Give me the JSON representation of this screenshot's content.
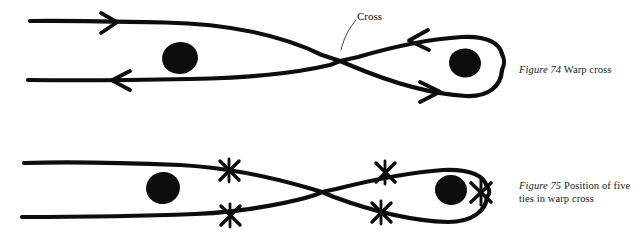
{
  "page": {
    "width": 638,
    "height": 232,
    "background": "#ffffff",
    "ink_color": "#0d0d0d",
    "style": "hand-drawn pen and ink weaving diagram"
  },
  "annotations": {
    "cross_label": "Cross"
  },
  "figures": [
    {
      "id": "figure-74",
      "number": "Figure 74",
      "title": "Warp cross",
      "caption_line_1": "Figure 74  Warp",
      "caption_line_2": "cross",
      "arrows": [
        {
          "name": "upper-left-arrow",
          "direction": "right",
          "x": 110,
          "y": 23
        },
        {
          "name": "lower-left-arrow",
          "direction": "left",
          "x": 118,
          "y": 82
        },
        {
          "name": "upper-right-arrow",
          "direction": "left",
          "x": 416,
          "y": 40
        },
        {
          "name": "lower-right-arrow",
          "direction": "right",
          "x": 433,
          "y": 92
        }
      ],
      "blobs": [
        {
          "name": "left-warp-blob",
          "cx": 180,
          "cy": 58,
          "rx": 18,
          "ry": 16
        },
        {
          "name": "right-warp-blob",
          "cx": 465,
          "cy": 63,
          "rx": 16,
          "ry": 14
        }
      ],
      "cross_point": {
        "x": 340,
        "y": 61
      },
      "tie_count": 0
    },
    {
      "id": "figure-75",
      "number": "Figure 75",
      "title": "Position of five ties in warp cross",
      "caption_line_1": "Figure 75  Position",
      "caption_line_2": "of five ties in warp",
      "caption_line_3": "cross",
      "arrows": [],
      "blobs": [
        {
          "name": "left-warp-blob",
          "cx": 163,
          "cy": 188,
          "rx": 17,
          "ry": 16
        },
        {
          "name": "right-warp-blob",
          "cx": 451,
          "cy": 190,
          "rx": 16,
          "ry": 15
        }
      ],
      "cross_point": {
        "x": 322,
        "y": 192
      },
      "tie_count": 5,
      "ties": [
        {
          "name": "tie-upper-left",
          "cx": 229,
          "cy": 170
        },
        {
          "name": "tie-lower-left",
          "cx": 230,
          "cy": 215
        },
        {
          "name": "tie-upper-right",
          "cx": 385,
          "cy": 172
        },
        {
          "name": "tie-lower-right",
          "cx": 381,
          "cy": 212
        },
        {
          "name": "tie-loop-end",
          "cx": 481,
          "cy": 192
        }
      ]
    }
  ]
}
